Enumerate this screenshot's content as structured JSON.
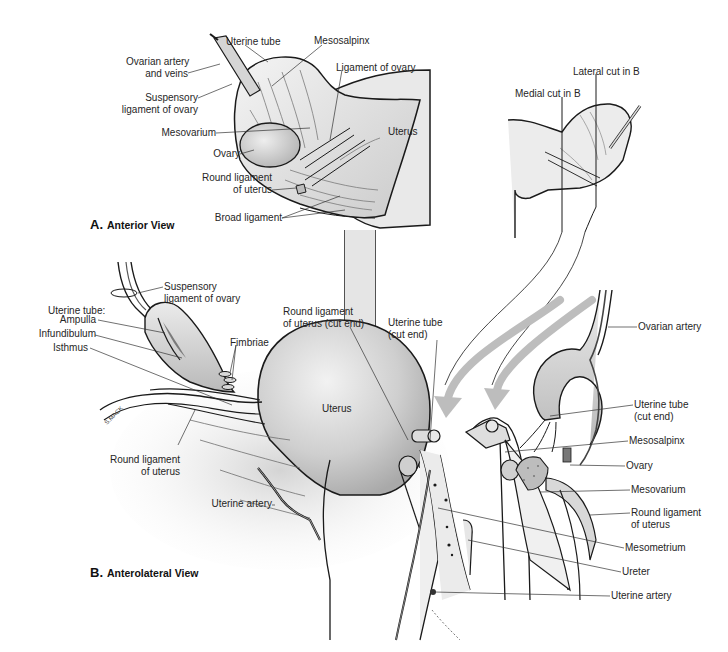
{
  "figure": {
    "panels": [
      {
        "id": "A",
        "letter": "A.",
        "title": "Anterior View",
        "labels": {
          "uterine_tube": "Uterine tube",
          "mesosalpinx": "Mesosalpinx",
          "ovarian_artery_veins_1": "Ovarian artery",
          "ovarian_artery_veins_2": "and veins",
          "suspensory_1": "Suspensory",
          "suspensory_2": "ligament of ovary",
          "ligament_of_ovary": "Ligament of ovary",
          "mesovarium": "Mesovarium",
          "uterus": "Uterus",
          "ovary": "Ovary",
          "round_lig_1": "Round ligament",
          "round_lig_2": "of uterus",
          "broad_ligament": "Broad ligament",
          "medial_cut": "Medial cut in B",
          "lateral_cut": "Lateral cut in B"
        }
      },
      {
        "id": "B",
        "letter": "B.",
        "title": "Anterolateral View",
        "labels": {
          "suspensory_1": "Suspensory",
          "suspensory_2": "ligament of ovary",
          "uterine_tube_header": "Uterine tube:",
          "ampulla": "Ampulla",
          "infundibulum": "Infundibulum",
          "isthmus": "Isthmus",
          "fimbriae": "Fimbriae",
          "round_lig_cut_1": "Round ligament",
          "round_lig_cut_2": "of uterus (cut end)",
          "uterine_tube_cut_1": "Uterine tube",
          "uterine_tube_cut_2": "(cut end)",
          "uterus": "Uterus",
          "round_lig_left_1": "Round ligament",
          "round_lig_left_2": "of uterus",
          "uterine_artery_left": "Uterine artery",
          "ovarian_artery": "Ovarian artery",
          "uterine_tube_cut_r1": "Uterine tube",
          "uterine_tube_cut_r2": "(cut end)",
          "mesosalpinx": "Mesosalpinx",
          "ovary": "Ovary",
          "mesovarium": "Mesovarium",
          "round_lig_r1": "Round ligament",
          "round_lig_r2": "of uterus",
          "mesometrium": "Mesometrium",
          "ureter": "Ureter",
          "uterine_artery_right": "Uterine artery"
        }
      }
    ],
    "signature": "S.MACK"
  },
  "colors": {
    "outline": "#1a1a1a",
    "tissue_light": "#e6e6e6",
    "tissue_mid": "#c8c8c8",
    "tissue_dark": "#a8a8a8",
    "arrow": "#bdbdbd",
    "leader": "#333333"
  }
}
